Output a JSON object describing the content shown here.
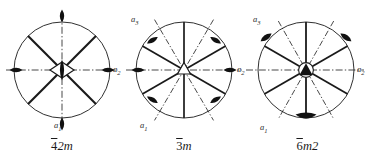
{
  "figure": {
    "kind": "crystallographic-point-group-symmetry-diagrams",
    "background_color": "#ffffff",
    "ink_color": "#1a1a1a",
    "panel_count": 3
  },
  "panels": [
    {
      "id": "panel-1",
      "caption_bar_digit": "4",
      "caption_rest": "2m",
      "caption_plain": "4̅2m",
      "principal_axis_symbol": "4-bar-with-2-fold-lens",
      "circle": {
        "cx": 62,
        "cy": 70,
        "r": 48
      },
      "axis_labels": [
        {
          "name": "a1",
          "text": "a",
          "sub": "1",
          "x": 56,
          "y": 126
        },
        {
          "name": "a2",
          "text": "a",
          "sub": "2",
          "x": 113,
          "y": 66
        }
      ],
      "mirror_traces_solid_deg": [
        45,
        135
      ],
      "dash_dot_axes_deg": [
        0,
        90
      ],
      "two_fold_lens_deg": [
        0,
        90,
        180,
        270
      ],
      "solid_radial_lines_deg": [
        45,
        135,
        225,
        315
      ]
    },
    {
      "id": "panel-2",
      "caption_bar_digit": "3",
      "caption_rest": "m",
      "caption_plain": "3̅m",
      "principal_axis_symbol": "3-bar-open-triangle",
      "circle": {
        "cx": 64,
        "cy": 70,
        "r": 48
      },
      "axis_labels": [
        {
          "name": "a3",
          "text": "a",
          "sub": "3",
          "x": 14,
          "y": 16
        },
        {
          "name": "a2",
          "text": "a",
          "sub": "2",
          "x": 116,
          "y": 66
        },
        {
          "name": "a1",
          "text": "a",
          "sub": "1",
          "x": 22,
          "y": 122
        }
      ],
      "mirror_traces_solid_deg": [
        0,
        60,
        120
      ],
      "dash_dot_axes_deg": [
        30,
        90,
        150
      ],
      "two_fold_lens_deg": [
        30,
        90,
        150,
        210,
        270,
        330
      ],
      "solid_radial_lines_deg": [
        0,
        60,
        120,
        180,
        240,
        300
      ]
    },
    {
      "id": "panel-3",
      "caption_bar_digit": "6",
      "caption_rest": "m2",
      "caption_plain": "6̅m2",
      "principal_axis_symbol": "6-bar-filled-triangle-in-circle",
      "circle": {
        "cx": 62,
        "cy": 70,
        "r": 48
      },
      "axis_labels": [
        {
          "name": "a3",
          "text": "a",
          "sub": "3",
          "x": 12,
          "y": 16
        },
        {
          "name": "a2",
          "text": "a",
          "sub": "2",
          "x": 112,
          "y": 66
        },
        {
          "name": "a1",
          "text": "a",
          "sub": "1",
          "x": 18,
          "y": 124
        }
      ],
      "mirror_traces_solid_deg": [
        30,
        90,
        150
      ],
      "dash_dot_axes_deg": [
        0,
        60,
        120
      ],
      "two_fold_lens_deg": [
        30,
        90,
        150,
        210,
        270,
        330
      ],
      "solid_radial_lines_deg": [
        30,
        90,
        150,
        210,
        270,
        330
      ]
    }
  ],
  "legend_note": {
    "filled_lens": "two-fold rotation axis in plane of projection",
    "solid_line": "mirror plane trace",
    "dash_dot_line": "crystallographic reference axis"
  }
}
